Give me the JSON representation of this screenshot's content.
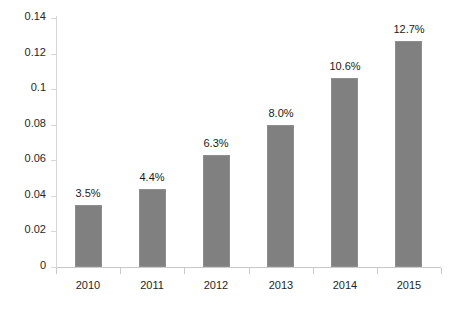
{
  "chart_data": {
    "type": "bar",
    "title": "",
    "subtitle": "",
    "xlabel": "",
    "ylabel": "",
    "categories": [
      "2010",
      "2011",
      "2012",
      "2013",
      "2014",
      "2015"
    ],
    "values": [
      0.035,
      0.044,
      0.063,
      0.08,
      0.106,
      0.127
    ],
    "data_labels": [
      "3.5%",
      "4.4%",
      "6.3%",
      "8.0%",
      "10.6%",
      "12.7%"
    ],
    "ylim": [
      0,
      0.14
    ],
    "ytick_values": [
      0,
      0.02,
      0.04,
      0.06,
      0.08,
      0.1,
      0.12,
      0.14
    ],
    "ytick_labels": [
      "0",
      "0.02",
      "0.04",
      "0.06",
      "0.08",
      "0.1",
      "0.12",
      "0.14"
    ],
    "grid": false,
    "legend": null,
    "legend_position": "none",
    "series": [
      {
        "name": "",
        "values": [
          0.035,
          0.044,
          0.063,
          0.08,
          0.106,
          0.127
        ]
      }
    ],
    "colors": {
      "bar_fill": "#808080",
      "bar_border": "#8e8e8e",
      "axis": "#c9c9c9",
      "tick_text": "#262626",
      "label_text": "#1a1a1a",
      "background": "#ffffff"
    }
  }
}
